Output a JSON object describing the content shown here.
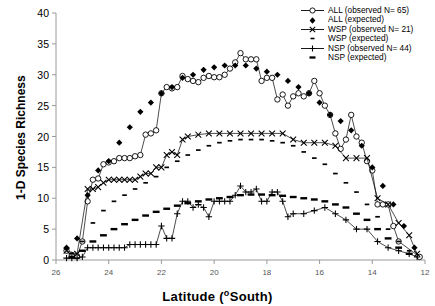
{
  "chart_data": {
    "type": "line",
    "title": "",
    "xlabel": "Latitude (°South)",
    "ylabel": "1-D Species Richness",
    "xlim": [
      26,
      12
    ],
    "ylim": [
      0,
      40
    ],
    "x_ticks": [
      26,
      24,
      22,
      20,
      18,
      16,
      14,
      12
    ],
    "y_ticks": [
      0,
      5,
      10,
      15,
      20,
      25,
      30,
      35,
      40
    ],
    "x_reversed": true,
    "grid": false,
    "legend_position": "top-right",
    "series": [
      {
        "name": "ALL (observed N= 65)",
        "marker": "open-circle",
        "line": true,
        "x": [
          25.6,
          25.4,
          25.2,
          25.0,
          24.8,
          24.6,
          24.4,
          24.2,
          24.0,
          23.8,
          23.6,
          23.4,
          23.2,
          23.0,
          22.8,
          22.6,
          22.4,
          22.2,
          22.0,
          21.8,
          21.6,
          21.4,
          21.2,
          21.0,
          20.8,
          20.6,
          20.4,
          20.2,
          20.0,
          19.8,
          19.6,
          19.4,
          19.2,
          19.0,
          18.8,
          18.6,
          18.4,
          18.2,
          18.0,
          17.8,
          17.6,
          17.4,
          17.2,
          17.0,
          16.8,
          16.6,
          16.4,
          16.2,
          16.0,
          15.8,
          15.6,
          15.4,
          15.2,
          15.0,
          14.8,
          14.6,
          14.4,
          14.2,
          14.0,
          13.8,
          13.6,
          13.4,
          13.2,
          13.0,
          12.2
        ],
        "y": [
          1.5,
          0.8,
          0.6,
          3.0,
          9.5,
          13.0,
          13.2,
          15.5,
          15.8,
          16.0,
          16.5,
          16.5,
          16.5,
          16.8,
          17.0,
          20.3,
          20.5,
          21.0,
          27.0,
          28.0,
          27.8,
          28.0,
          29.8,
          29.3,
          29.0,
          28.8,
          29.5,
          29.8,
          29.6,
          29.6,
          30.0,
          31.0,
          32.0,
          33.5,
          32.5,
          32.5,
          32.5,
          29.0,
          29.5,
          29.5,
          26.0,
          26.8,
          25.0,
          26.5,
          27.0,
          26.5,
          27.0,
          29.0,
          27.0,
          25.0,
          23.5,
          20.5,
          18.0,
          19.5,
          23.5,
          20.0,
          19.0,
          16.0,
          14.5,
          9.0,
          9.0,
          9.0,
          5.5,
          3.0,
          0.5
        ]
      },
      {
        "name": "ALL (expected)",
        "marker": "filled-diamond",
        "line": false,
        "x": [
          25.6,
          25.2,
          24.8,
          24.4,
          24.0,
          23.6,
          23.2,
          22.8,
          22.4,
          22.0,
          21.6,
          21.2,
          20.8,
          20.4,
          20.0,
          19.6,
          19.2,
          18.8,
          18.4,
          18.0,
          17.6,
          17.2,
          16.8,
          16.4,
          16.0,
          15.6,
          15.2,
          14.8,
          14.4,
          14.0,
          13.6,
          13.2,
          12.8,
          12.4
        ],
        "y": [
          2.0,
          3.5,
          10.5,
          14.5,
          16.0,
          19.0,
          21.5,
          24.0,
          25.5,
          27.0,
          28.0,
          29.5,
          30.0,
          30.8,
          31.2,
          31.5,
          31.5,
          31.5,
          31.0,
          30.5,
          30.0,
          29.0,
          28.0,
          27.0,
          25.5,
          23.5,
          22.5,
          21.0,
          18.5,
          15.0,
          12.0,
          9.0,
          5.5,
          2.0
        ]
      },
      {
        "name": "WSP (observed N= 21)",
        "marker": "cross-x",
        "line": true,
        "x": [
          25.6,
          25.2,
          24.8,
          24.6,
          24.4,
          24.2,
          24.0,
          23.8,
          23.6,
          23.4,
          23.2,
          23.0,
          22.8,
          22.6,
          22.4,
          22.2,
          22.0,
          21.8,
          21.6,
          21.4,
          21.2,
          21.0,
          20.6,
          20.2,
          19.8,
          19.4,
          19.0,
          18.6,
          18.2,
          17.8,
          17.4,
          17.0,
          16.6,
          16.2,
          15.8,
          15.4,
          15.0,
          14.6,
          14.2,
          13.8,
          13.4,
          13.0,
          12.6,
          12.3
        ],
        "y": [
          1.5,
          1.0,
          11.5,
          11.5,
          11.8,
          12.5,
          13.0,
          13.0,
          13.0,
          13.0,
          13.0,
          13.0,
          13.5,
          14.0,
          14.0,
          15.0,
          15.0,
          17.0,
          17.5,
          17.0,
          19.5,
          20.0,
          20.3,
          20.5,
          20.5,
          20.5,
          20.5,
          20.5,
          20.5,
          20.5,
          20.5,
          19.5,
          19.0,
          19.0,
          19.0,
          18.5,
          16.5,
          16.5,
          16.5,
          10.0,
          9.0,
          6.0,
          4.0,
          1.0
        ]
      },
      {
        "name": "WSP (expected)",
        "marker": "small-dash",
        "line": false,
        "x": [
          25.4,
          25.0,
          24.6,
          24.2,
          23.8,
          23.4,
          23.0,
          22.6,
          22.2,
          21.8,
          21.4,
          21.0,
          20.6,
          20.2,
          19.8,
          19.4,
          19.0,
          18.6,
          18.2,
          17.8,
          17.4,
          17.0,
          16.6,
          16.2,
          15.8,
          15.4,
          15.0,
          14.6,
          14.2,
          13.8,
          13.4,
          13.0,
          12.6
        ],
        "y": [
          1.0,
          3.0,
          6.0,
          8.0,
          9.5,
          10.5,
          11.5,
          12.5,
          13.5,
          15.0,
          16.0,
          17.0,
          17.8,
          18.5,
          19.0,
          19.3,
          19.5,
          19.5,
          19.5,
          19.3,
          19.0,
          18.5,
          17.5,
          16.5,
          15.5,
          14.0,
          12.5,
          11.0,
          9.0,
          7.0,
          5.0,
          3.0,
          1.5
        ]
      },
      {
        "name": "NSP (observed N= 44)",
        "marker": "plus",
        "line": true,
        "x": [
          25.6,
          25.4,
          25.2,
          25.0,
          24.8,
          24.6,
          24.4,
          24.2,
          24.0,
          23.8,
          23.6,
          23.4,
          23.2,
          23.0,
          22.8,
          22.6,
          22.4,
          22.2,
          22.0,
          21.8,
          21.6,
          21.4,
          21.2,
          21.0,
          20.8,
          20.6,
          20.4,
          20.2,
          20.0,
          19.8,
          19.6,
          19.4,
          19.2,
          19.0,
          18.8,
          18.6,
          18.4,
          18.2,
          18.0,
          17.8,
          17.6,
          17.4,
          17.2,
          17.0,
          16.6,
          16.2,
          15.8,
          15.4,
          15.0,
          14.6,
          14.2,
          13.8,
          13.4,
          13.0,
          12.6,
          12.3
        ],
        "y": [
          0.3,
          0.3,
          0.3,
          0.5,
          2.0,
          2.0,
          2.0,
          2.0,
          2.0,
          2.0,
          2.0,
          2.0,
          2.5,
          2.5,
          2.5,
          2.5,
          2.5,
          2.5,
          5.5,
          3.5,
          3.5,
          7.5,
          9.5,
          9.5,
          8.5,
          9.0,
          8.5,
          7.0,
          9.5,
          9.5,
          9.5,
          9.5,
          10.5,
          12.0,
          11.0,
          11.0,
          11.5,
          9.5,
          9.5,
          11.0,
          11.0,
          9.5,
          7.0,
          7.5,
          7.5,
          8.0,
          8.5,
          7.5,
          6.5,
          5.0,
          5.0,
          3.0,
          2.0,
          1.5,
          1.0,
          0.5
        ]
      },
      {
        "name": "NSP (expected)",
        "marker": "thick-dash",
        "line": false,
        "x": [
          25.4,
          25.0,
          24.6,
          24.2,
          23.8,
          23.4,
          23.0,
          22.6,
          22.2,
          21.8,
          21.4,
          21.0,
          20.6,
          20.2,
          19.8,
          19.4,
          19.0,
          18.6,
          18.2,
          17.8,
          17.4,
          17.0,
          16.6,
          16.2,
          15.8,
          15.4,
          15.0,
          14.6,
          14.2,
          13.8,
          13.4,
          13.0,
          12.6
        ],
        "y": [
          0.5,
          1.5,
          3.0,
          4.0,
          5.0,
          5.8,
          6.5,
          7.2,
          7.8,
          8.3,
          8.8,
          9.2,
          9.5,
          9.8,
          10.0,
          10.2,
          10.5,
          10.6,
          10.6,
          10.5,
          10.4,
          10.2,
          10.0,
          9.8,
          9.5,
          9.0,
          8.5,
          7.5,
          6.5,
          5.0,
          3.5,
          2.0,
          1.0
        ]
      }
    ]
  },
  "legend": {
    "items": [
      {
        "label": "ALL (observed N= 65)",
        "marker": "open-circle-line"
      },
      {
        "label": "ALL (expected)",
        "marker": "filled-diamond"
      },
      {
        "label": "WSP (observed N= 21)",
        "marker": "cross-x-line"
      },
      {
        "label": "WSP (expected)",
        "marker": "small-dash"
      },
      {
        "label": "NSP (observed N= 44)",
        "marker": "plus-line"
      },
      {
        "label": "NSP (expected)",
        "marker": "thick-dash"
      }
    ]
  },
  "axes": {
    "x_title_main": "Latitude (",
    "x_title_sup": "o",
    "x_title_tail": "South)",
    "y_title": "1-D Species Richness"
  }
}
